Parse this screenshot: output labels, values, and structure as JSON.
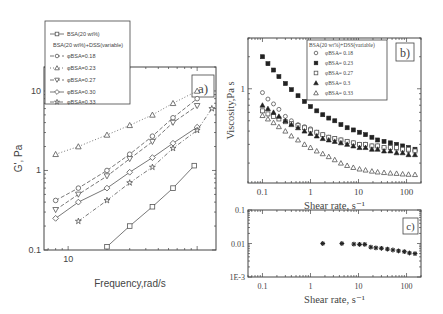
{
  "chart_data": [
    {
      "id": "a",
      "type": "line",
      "panel_label": "a)",
      "xlabel": "Frequency,rad/s",
      "ylabel": "G', Pa",
      "xscale": "log",
      "yscale": "log",
      "xlim": [
        6.5,
        140
      ],
      "ylim": [
        0.1,
        20
      ],
      "xticks": [
        {
          "v": 10,
          "label": "10"
        }
      ],
      "yticks": [
        {
          "v": 0.1,
          "label": "0.1"
        },
        {
          "v": 1,
          "label": "1"
        },
        {
          "v": 10,
          "label": "10"
        }
      ],
      "legend": {
        "placement": "top-left-outside",
        "title_lines": [
          "BSA(20 wt%)",
          "BSA(20 wt%)+DSS(variable)"
        ],
        "entries": [
          {
            "label": "BSA(20 wt%)",
            "marker": "square",
            "dash": "solid"
          },
          {
            "label": "φBSA=0.18",
            "marker": "circle",
            "dash": "dash"
          },
          {
            "label": "φBSA=0.23",
            "marker": "triangle",
            "dash": "dot"
          },
          {
            "label": "φBSA=0.27",
            "marker": "triangle-down",
            "dash": "dash"
          },
          {
            "label": "φBSA=0.30",
            "marker": "diamond",
            "dash": "solid"
          },
          {
            "label": "φBSA=0.33",
            "marker": "star",
            "dash": "dashdot"
          }
        ]
      },
      "series": [
        {
          "name": "BSA(20 wt%)",
          "marker": "square",
          "dash": "solid",
          "x": [
            20,
            30,
            45,
            65,
            95
          ],
          "y": [
            0.11,
            0.2,
            0.35,
            0.6,
            1.15
          ]
        },
        {
          "name": "φBSA=0.18",
          "marker": "circle",
          "dash": "dash",
          "x": [
            8,
            12,
            20,
            30,
            45,
            65,
            100
          ],
          "y": [
            0.42,
            0.6,
            1.0,
            1.6,
            2.7,
            4.6,
            8.0
          ]
        },
        {
          "name": "φBSA=0.23",
          "marker": "triangle",
          "dash": "dot",
          "x": [
            8,
            12,
            20,
            30,
            45,
            65,
            100
          ],
          "y": [
            1.6,
            2.0,
            2.8,
            3.7,
            5.0,
            7.0,
            10.0
          ]
        },
        {
          "name": "φBSA=0.27",
          "marker": "triangle-down",
          "dash": "dash",
          "x": [
            8,
            12,
            20,
            30,
            45,
            65,
            100
          ],
          "y": [
            0.32,
            0.5,
            0.85,
            1.4,
            2.3,
            4.0,
            6.5
          ]
        },
        {
          "name": "φBSA=0.30",
          "marker": "diamond",
          "dash": "solid",
          "x": [
            8,
            12,
            20,
            30,
            45,
            65,
            100
          ],
          "y": [
            0.25,
            0.4,
            0.6,
            0.95,
            1.45,
            2.2,
            3.5
          ]
        },
        {
          "name": "φBSA=0.33",
          "marker": "star",
          "dash": "dashdot",
          "x": [
            12,
            20,
            30,
            45,
            65,
            100,
            130
          ],
          "y": [
            0.23,
            0.42,
            0.7,
            1.1,
            1.9,
            3.2,
            6.0
          ]
        }
      ]
    },
    {
      "id": "b",
      "type": "scatter",
      "panel_label": "b)",
      "xlabel": "Shear rate, s⁻¹",
      "ylabel": "Viscosity,Pa s",
      "xscale": "log",
      "yscale": "log",
      "xlim": [
        0.05,
        200
      ],
      "ylim": [
        0.13,
        3
      ],
      "xticks": [
        {
          "v": 0.1,
          "label": "0.1"
        },
        {
          "v": 1,
          "label": "1"
        },
        {
          "v": 10,
          "label": "10"
        },
        {
          "v": 100,
          "label": "100"
        }
      ],
      "yticks": [
        {
          "v": 1,
          "label": "1"
        }
      ],
      "legend": {
        "placement": "top-right",
        "title": "BSA(20 wt%)+DSS(variable)",
        "entries": [
          {
            "label": "φBSA= 0.18",
            "marker": "circle"
          },
          {
            "label": "φBSA= 0.23",
            "marker": "square-filled"
          },
          {
            "label": "φBSA= 0.27",
            "marker": "square"
          },
          {
            "label": "φBSA= 0.3",
            "marker": "triangle-filled"
          },
          {
            "label": "φBSA= 0.33",
            "marker": "triangle"
          }
        ]
      },
      "x": [
        0.1,
        0.13,
        0.17,
        0.22,
        0.3,
        0.4,
        0.55,
        0.75,
        1.0,
        1.35,
        1.8,
        2.4,
        3.2,
        4.3,
        5.8,
        7.8,
        10.5,
        14,
        19,
        25,
        34,
        46,
        62,
        83,
        110,
        150
      ],
      "series": [
        {
          "name": "φBSA= 0.18",
          "marker": "circle",
          "y": [
            0.92,
            0.8,
            0.72,
            0.64,
            0.55,
            0.5,
            0.46,
            0.44,
            0.42,
            0.39,
            0.37,
            0.35,
            0.34,
            0.33,
            0.32,
            0.31,
            0.3,
            0.3,
            0.29,
            0.29,
            0.28,
            0.28,
            0.27,
            0.27,
            0.26,
            0.26
          ]
        },
        {
          "name": "φBSA= 0.23",
          "marker": "square-filled",
          "y": [
            2.0,
            1.72,
            1.5,
            1.3,
            1.12,
            0.98,
            0.86,
            0.76,
            0.68,
            0.62,
            0.57,
            0.53,
            0.5,
            0.46,
            0.43,
            0.41,
            0.39,
            0.37,
            0.35,
            0.33,
            0.32,
            0.31,
            0.3,
            0.29,
            0.28,
            0.27
          ]
        },
        {
          "name": "φBSA= 0.27",
          "marker": "square",
          "y": [
            0.62,
            0.58,
            0.55,
            0.52,
            0.49,
            0.47,
            0.45,
            0.43,
            0.41,
            0.39,
            0.37,
            0.35,
            0.34,
            0.33,
            0.32,
            0.31,
            0.3,
            0.3,
            0.29,
            0.29,
            0.28,
            0.28,
            0.28,
            0.27,
            0.27,
            0.26
          ]
        },
        {
          "name": "φBSA= 0.3",
          "marker": "triangle-filled",
          "y": [
            0.7,
            0.65,
            0.6,
            0.55,
            0.5,
            0.46,
            0.43,
            0.4,
            0.38,
            0.36,
            0.34,
            0.33,
            0.32,
            0.31,
            0.3,
            0.29,
            0.28,
            0.28,
            0.27,
            0.27,
            0.26,
            0.26,
            0.25,
            0.25,
            0.24,
            0.24
          ]
        },
        {
          "name": "φBSA= 0.33",
          "marker": "triangle",
          "y": [
            0.56,
            0.52,
            0.48,
            0.44,
            0.4,
            0.36,
            0.33,
            0.3,
            0.28,
            0.26,
            0.245,
            0.23,
            0.215,
            0.2,
            0.19,
            0.182,
            0.176,
            0.172,
            0.168,
            0.165,
            0.163,
            0.161,
            0.16,
            0.158,
            0.157,
            0.156
          ]
        }
      ]
    },
    {
      "id": "c",
      "type": "scatter",
      "panel_label": "c)",
      "xlabel": "Shear rate, s⁻¹",
      "ylabel": "",
      "xscale": "log",
      "yscale": "log",
      "xlim": [
        0.05,
        200
      ],
      "ylim": [
        0.001,
        0.1
      ],
      "xticks": [
        {
          "v": 0.1,
          "label": "0.1"
        },
        {
          "v": 1,
          "label": "1"
        },
        {
          "v": 10,
          "label": "10"
        },
        {
          "v": 100,
          "label": "100"
        }
      ],
      "yticks": [
        {
          "v": 0.001,
          "label": "1E-3"
        },
        {
          "v": 0.01,
          "label": "0.01"
        },
        {
          "v": 0.1,
          "label": "0.1"
        }
      ],
      "series": [
        {
          "name": "data",
          "marker": "asterisk",
          "x": [
            1.8,
            4.5,
            8,
            10.5,
            13.5,
            18,
            23,
            30,
            40,
            52,
            68,
            90,
            115,
            150
          ],
          "y": [
            0.01,
            0.01,
            0.0096,
            0.0094,
            0.0094,
            0.0078,
            0.0074,
            0.0072,
            0.0068,
            0.0064,
            0.006,
            0.0057,
            0.0052,
            0.005
          ]
        }
      ]
    }
  ]
}
